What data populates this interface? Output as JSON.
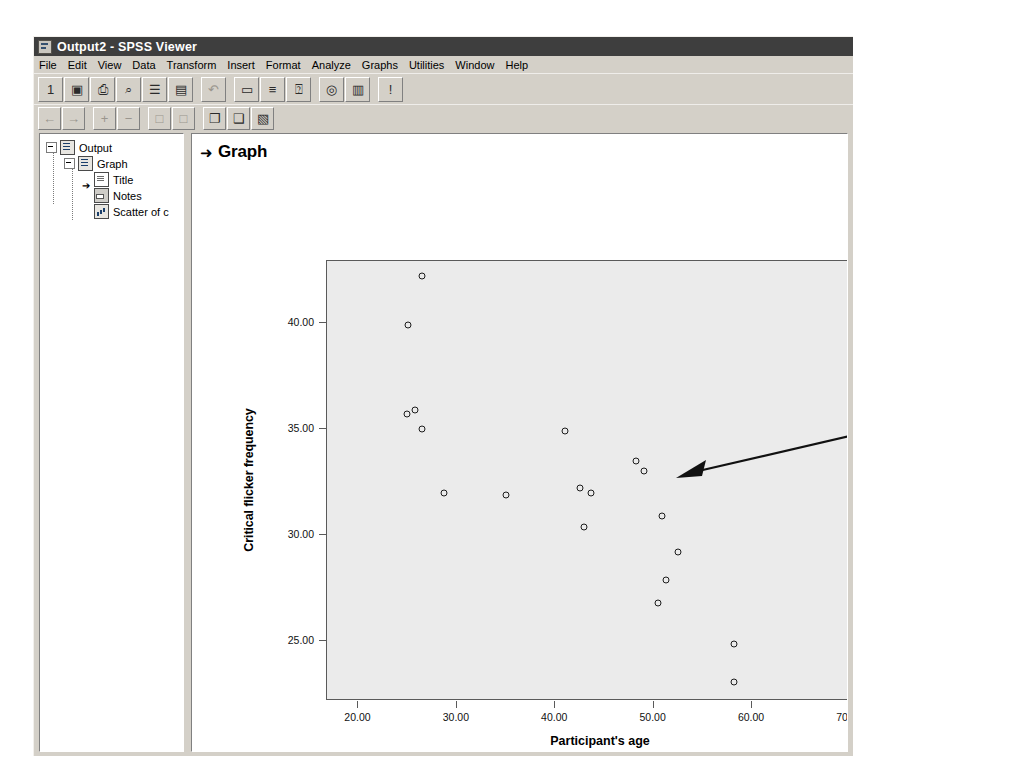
{
  "window": {
    "title": "Output2 - SPSS Viewer",
    "icon": "spss-viewer-icon"
  },
  "menubar": {
    "items": [
      {
        "label": "File"
      },
      {
        "label": "Edit"
      },
      {
        "label": "View"
      },
      {
        "label": "Data"
      },
      {
        "label": "Transform"
      },
      {
        "label": "Insert"
      },
      {
        "label": "Format"
      },
      {
        "label": "Analyze"
      },
      {
        "label": "Graphs"
      },
      {
        "label": "Utilities"
      },
      {
        "label": "Window"
      },
      {
        "label": "Help"
      }
    ]
  },
  "toolbar_main": {
    "buttons": [
      {
        "name": "open-file-icon",
        "glyph": "὜1",
        "enabled": true
      },
      {
        "name": "save-icon",
        "glyph": "▣",
        "enabled": true
      },
      {
        "name": "print-icon",
        "glyph": "⎙",
        "enabled": true
      },
      {
        "name": "print-preview-icon",
        "glyph": "⌕",
        "enabled": true
      },
      {
        "name": "export-icon",
        "glyph": "☰",
        "enabled": true
      },
      {
        "name": "insert-object-icon",
        "glyph": "▤",
        "enabled": true
      },
      {
        "name": "undo-icon",
        "glyph": "↶",
        "enabled": false
      },
      {
        "name": "show-hide-icon",
        "glyph": "▭",
        "enabled": true
      },
      {
        "name": "promote-icon",
        "glyph": "≡",
        "enabled": true
      },
      {
        "name": "variables-icon",
        "glyph": "⍰",
        "enabled": true
      },
      {
        "name": "use-sets-icon",
        "glyph": "◎",
        "enabled": true
      },
      {
        "name": "go-to-data-icon",
        "glyph": "▥",
        "enabled": true
      },
      {
        "name": "help-pointer-icon",
        "glyph": "!",
        "enabled": true
      }
    ]
  },
  "toolbar_secondary": {
    "buttons": [
      {
        "name": "back-icon",
        "glyph": "←",
        "enabled": false
      },
      {
        "name": "forward-icon",
        "glyph": "→",
        "enabled": false
      },
      {
        "name": "promote-plus-icon",
        "glyph": "+",
        "enabled": false
      },
      {
        "name": "demote-minus-icon",
        "glyph": "−",
        "enabled": false
      },
      {
        "name": "expand-icon",
        "glyph": "□",
        "enabled": false
      },
      {
        "name": "collapse-icon",
        "glyph": "□",
        "enabled": false
      },
      {
        "name": "show-results-icon",
        "glyph": "❐",
        "enabled": true
      },
      {
        "name": "hide-results-icon",
        "glyph": "❑",
        "enabled": true
      },
      {
        "name": "insert-heading-icon",
        "glyph": "▧",
        "enabled": true
      }
    ]
  },
  "outline": {
    "items": [
      {
        "label": "Output",
        "icon": "output-doc-icon",
        "level": 0,
        "expander": "minus"
      },
      {
        "label": "Graph",
        "icon": "graph-doc-icon",
        "level": 1,
        "expander": "minus"
      },
      {
        "label": "Title",
        "icon": "title-icon",
        "level": 2,
        "selected_arrow": true
      },
      {
        "label": "Notes",
        "icon": "notes-icon",
        "level": 2,
        "selected_arrow": false
      },
      {
        "label": "Scatter of c",
        "icon": "chart-icon",
        "level": 2,
        "selected_arrow": false
      }
    ]
  },
  "content": {
    "heading": "Graph",
    "heading_marker": "➜"
  },
  "callout": {
    "text": "Put the cursor anywhere inside the scattergram, and double-click to open the SPSS Chart Editor window.\nNB For versions earlier than 13, the scattergram background is clear.",
    "background_color": "#bdbdbd",
    "arrow": "pointer-arrow-icon"
  },
  "chart_data": {
    "type": "scatter",
    "title": "Graph",
    "xlabel": "Participant's age",
    "ylabel": "Critical flicker frequency",
    "xlim": [
      16.8,
      72.5
    ],
    "ylim": [
      22.2,
      42.9
    ],
    "xticks": [
      20.0,
      30.0,
      40.0,
      50.0,
      60.0,
      70.0
    ],
    "yticks": [
      25.0,
      30.0,
      35.0,
      40.0
    ],
    "xtick_labels": [
      "20.00",
      "30.00",
      "40.00",
      "50.00",
      "60.00",
      "70.00"
    ],
    "ytick_labels": [
      "25.00",
      "30.00",
      "35.00",
      "40.00"
    ],
    "grid": false,
    "legend": false,
    "marker": "open-circle",
    "marker_color": "#1c1c1c",
    "plot_background": "#ebebeb",
    "points": [
      {
        "x": 26.5,
        "y": 42.2
      },
      {
        "x": 25.0,
        "y": 39.9
      },
      {
        "x": 24.9,
        "y": 35.7
      },
      {
        "x": 25.7,
        "y": 35.9
      },
      {
        "x": 26.5,
        "y": 35.0
      },
      {
        "x": 28.7,
        "y": 32.0
      },
      {
        "x": 35.0,
        "y": 31.9
      },
      {
        "x": 41.0,
        "y": 34.9
      },
      {
        "x": 42.5,
        "y": 32.2
      },
      {
        "x": 43.6,
        "y": 32.0
      },
      {
        "x": 42.9,
        "y": 30.4
      },
      {
        "x": 48.2,
        "y": 33.5
      },
      {
        "x": 49.0,
        "y": 33.0
      },
      {
        "x": 50.9,
        "y": 30.9
      },
      {
        "x": 52.5,
        "y": 29.2
      },
      {
        "x": 51.3,
        "y": 27.9
      },
      {
        "x": 50.4,
        "y": 26.8
      },
      {
        "x": 58.2,
        "y": 24.9
      },
      {
        "x": 58.2,
        "y": 23.1
      }
    ]
  }
}
